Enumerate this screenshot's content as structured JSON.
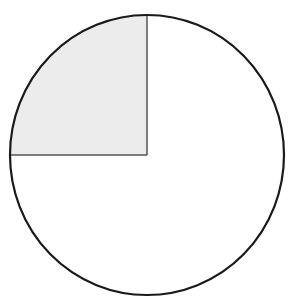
{
  "diagram": {
    "type": "fraction-circle",
    "shaded_fraction": "1/4",
    "shaded_quadrant": "top-left",
    "colors": {
      "background": "#ffffff",
      "outline": "#1a1a1a",
      "divider": "#555555",
      "shade": "#ececec"
    }
  }
}
